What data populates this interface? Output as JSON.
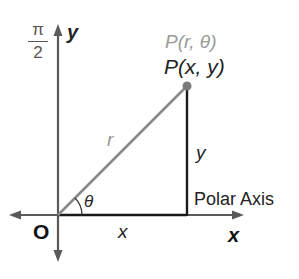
{
  "diagram": {
    "colors": {
      "axis": "#595959",
      "radius": "#8a8a8a",
      "leg": "#1a1a1a",
      "polar_label": "#9a9a9a",
      "text": "#222222"
    },
    "labels": {
      "pi_numerator": "π",
      "pi_denominator": "2",
      "y_axis": "y",
      "x_axis": "x",
      "origin": "O",
      "polar_point": "P(r, θ)",
      "rect_point": "P(x, y)",
      "radius": "r",
      "angle": "θ",
      "leg_vertical": "y",
      "leg_horizontal": "x",
      "polar_axis": "Polar Axis"
    },
    "geometry": {
      "origin": [
        58,
        215
      ],
      "point_P": [
        187,
        86
      ]
    }
  }
}
